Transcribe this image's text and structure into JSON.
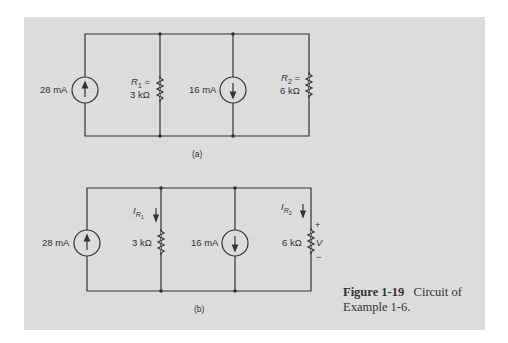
{
  "figure": {
    "number": "Figure 1-19",
    "caption_text": "Circuit of",
    "caption_text_2": "Example 1-6."
  },
  "circuit_a": {
    "label": "(a)",
    "source1": {
      "value": "28 mA",
      "direction": "up"
    },
    "r1": {
      "name": "R",
      "sub": "1",
      "eq": " =",
      "value": "3 kΩ"
    },
    "source2": {
      "value": "16 mA",
      "direction": "down"
    },
    "r2": {
      "name": "R",
      "sub": "2",
      "eq": " =",
      "value": "6 kΩ"
    }
  },
  "circuit_b": {
    "label": "(b)",
    "source1": {
      "value": "28 mA",
      "direction": "up"
    },
    "r1": {
      "value": "3 kΩ",
      "current_name": "I",
      "current_sub": "R",
      "current_sub2": "1"
    },
    "source2": {
      "value": "16 mA",
      "direction": "down"
    },
    "r2": {
      "value": "6 kΩ",
      "current_name": "I",
      "current_sub": "R",
      "current_sub2": "2",
      "voltage": "V",
      "plus": "+",
      "minus": "−"
    }
  },
  "colors": {
    "panel": "#dcdcdc",
    "ink": "#333333",
    "page": "#ffffff"
  }
}
